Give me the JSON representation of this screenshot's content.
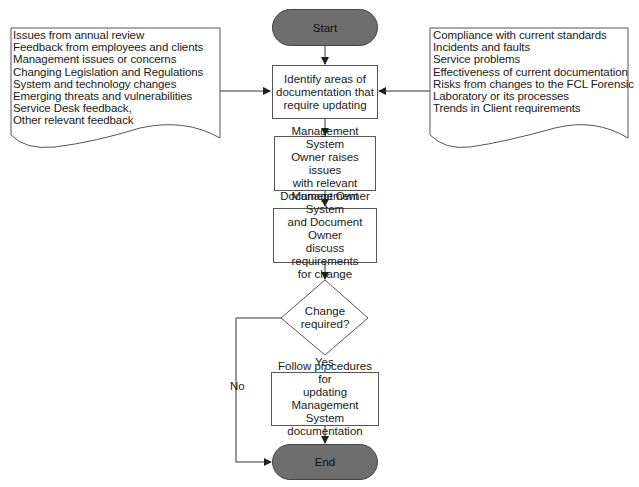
{
  "left_input": {
    "items": [
      "Issues from annual review",
      "Feedback from employees and clients",
      "Management issues or concerns",
      "Changing Legislation and Regulations",
      "System and technology changes",
      "Emerging threats and vulnerabilities",
      "Service Desk feedback,",
      "Other relevant feedback"
    ]
  },
  "right_input": {
    "items": [
      "Compliance with current standards",
      "Incidents and faults",
      "Service problems",
      "Effectiveness of current documentation",
      "Risks from changes to the FCL Forensic",
      "Laboratory or its processes",
      "Trends in Client requirements"
    ]
  },
  "flow": {
    "start": "Start",
    "step1": [
      "Identify areas of",
      "documentation that",
      "require updating"
    ],
    "step2": [
      "Management System",
      "Owner raises issues",
      "with relevant",
      "Document Owner"
    ],
    "step3": [
      "Management System",
      "and Document Owner",
      "discuss requirements",
      "for change"
    ],
    "decision": [
      "Change",
      "required?"
    ],
    "yes_label": "Yes",
    "no_label": "No",
    "step4": [
      "Follow procedures for",
      "updating Management",
      "System",
      "documentation"
    ],
    "end": "End"
  },
  "colors": {
    "terminal_fill": "#6e6e6e",
    "line": "#333333"
  }
}
